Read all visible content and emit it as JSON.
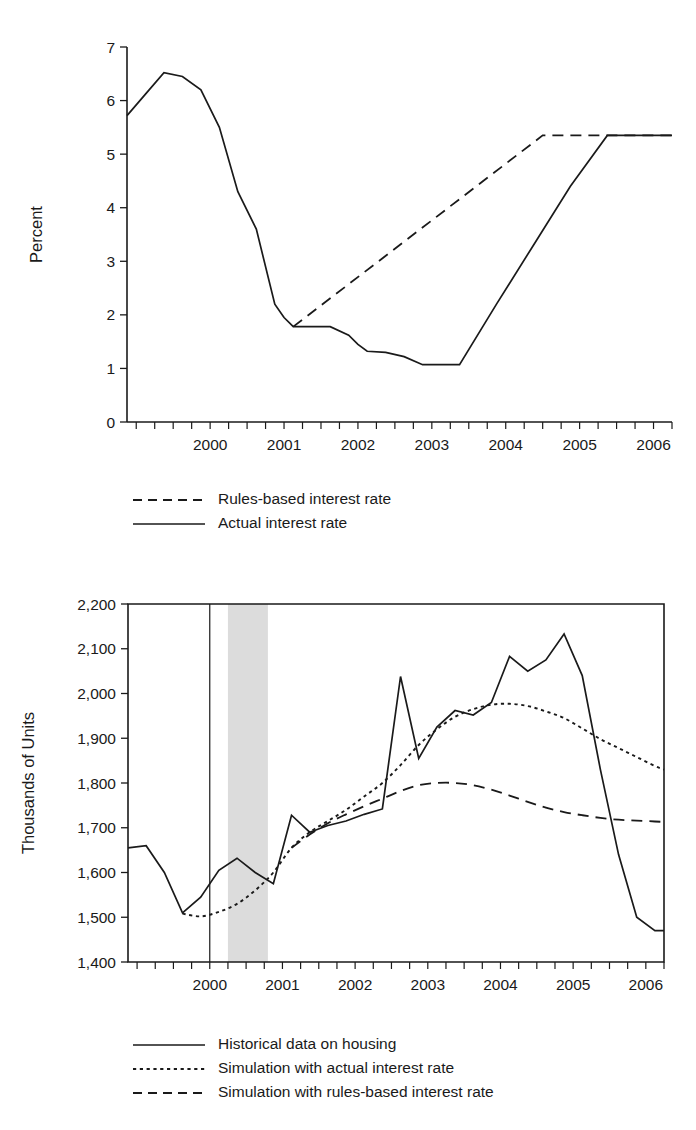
{
  "figure": {
    "background": "#ffffff",
    "ink_color": "#1a1a1a",
    "band_color": "#dcdcdc"
  },
  "chart_data": [
    {
      "id": "interest-rate-chart",
      "type": "line",
      "title": "",
      "xlabel": "",
      "ylabel": "Percent",
      "xlim": [
        1999.375,
        2006.75
      ],
      "ylim": [
        0,
        7
      ],
      "grid": false,
      "yticks": [
        0,
        1,
        2,
        3,
        4,
        5,
        6,
        7
      ],
      "ytick_labels": [
        "0",
        "1",
        "2",
        "3",
        "4",
        "5",
        "6",
        "7"
      ],
      "xtick_labels": [
        "2000",
        "2001",
        "2002",
        "2003",
        "2004",
        "2005",
        "2006"
      ],
      "xtick_label_positions": [
        2000.5,
        2001.5,
        2002.5,
        2003.5,
        2004.5,
        2005.5,
        2006.5
      ],
      "xtick_minor_step": 0.25,
      "legend_position": "below-left",
      "series": [
        {
          "name": "Rules-based interest rate",
          "style": "dashed",
          "x": [
            2001.625,
            2005.0,
            2006.75
          ],
          "values": [
            1.78,
            5.35,
            5.35
          ]
        },
        {
          "name": "Actual interest rate",
          "style": "solid",
          "x": [
            1999.375,
            1999.625,
            1999.875,
            2000.125,
            2000.375,
            2000.625,
            2000.875,
            2001.125,
            2001.375,
            2001.5,
            2001.625,
            2001.875,
            2002.125,
            2002.375,
            2002.5,
            2002.625,
            2002.875,
            2003.125,
            2003.375,
            2003.625,
            2003.875,
            2004.375,
            2004.875,
            2005.375,
            2005.875,
            2006.125,
            2006.375,
            2006.75
          ],
          "values": [
            5.72,
            6.12,
            6.52,
            6.45,
            6.2,
            5.5,
            4.3,
            3.6,
            2.2,
            1.95,
            1.78,
            1.78,
            1.78,
            1.62,
            1.45,
            1.32,
            1.3,
            1.22,
            1.07,
            1.07,
            1.07,
            2.2,
            3.3,
            4.4,
            5.35,
            5.35,
            5.35,
            5.35
          ]
        }
      ],
      "legend": [
        {
          "label": "Rules-based interest rate",
          "style": "dashed"
        },
        {
          "label": "Actual interest rate",
          "style": "solid"
        }
      ]
    },
    {
      "id": "housing-starts-chart",
      "type": "line",
      "title": "",
      "xlabel": "",
      "ylabel": "Thousands of Units",
      "xlim": [
        1999.375,
        2006.75
      ],
      "ylim": [
        1400,
        2200
      ],
      "grid": false,
      "yticks": [
        1400,
        1500,
        1600,
        1700,
        1800,
        1900,
        2000,
        2100,
        2200
      ],
      "ytick_labels": [
        "1,400",
        "1,500",
        "1,600",
        "1,700",
        "1,800",
        "1,900",
        "2,000",
        "2,100",
        "2,200"
      ],
      "xtick_labels": [
        "2000",
        "2001",
        "2002",
        "2003",
        "2004",
        "2005",
        "2006"
      ],
      "xtick_label_positions": [
        2000.5,
        2001.5,
        2002.5,
        2003.5,
        2004.5,
        2005.5,
        2006.5
      ],
      "xtick_minor_step": 0.25,
      "legend_position": "below-left",
      "recession_band": {
        "start": 2000.75,
        "end": 2001.3
      },
      "vertical_line": {
        "x": 2000.5
      },
      "series": [
        {
          "name": "Historical data on housing",
          "style": "solid",
          "x": [
            1999.375,
            1999.625,
            1999.875,
            2000.125,
            2000.375,
            2000.625,
            2000.875,
            2001.125,
            2001.375,
            2001.625,
            2001.875,
            2002.125,
            2002.375,
            2002.625,
            2002.875,
            2003.125,
            2003.375,
            2003.625,
            2003.875,
            2004.125,
            2004.375,
            2004.625,
            2004.875,
            2005.125,
            2005.375,
            2005.625,
            2005.875,
            2006.125,
            2006.375,
            2006.625,
            2006.75
          ],
          "values": [
            1655,
            1660,
            1600,
            1510,
            1545,
            1605,
            1632,
            1600,
            1575,
            1728,
            1690,
            1705,
            1715,
            1730,
            1742,
            2038,
            1855,
            1925,
            1962,
            1952,
            1980,
            2083,
            2050,
            2075,
            2133,
            2040,
            1830,
            1640,
            1500,
            1470,
            1470
          ]
        },
        {
          "name": "Simulation with actual interest rate",
          "style": "dotted",
          "x": [
            2000.125,
            2000.375,
            2000.625,
            2000.875,
            2001.125,
            2001.375,
            2001.625,
            2001.875,
            2002.125,
            2002.375,
            2002.625,
            2002.875,
            2003.125,
            2003.375,
            2003.625,
            2003.875,
            2004.125,
            2004.375,
            2004.625,
            2004.875,
            2005.125,
            2005.375,
            2005.625,
            2005.875,
            2006.125,
            2006.375,
            2006.625,
            2006.75
          ],
          "values": [
            1508,
            1502,
            1512,
            1530,
            1560,
            1600,
            1655,
            1690,
            1715,
            1740,
            1770,
            1800,
            1840,
            1885,
            1920,
            1948,
            1965,
            1975,
            1977,
            1972,
            1960,
            1945,
            1922,
            1898,
            1878,
            1858,
            1838,
            1830
          ]
        },
        {
          "name": "Simulation with rules-based interest rate",
          "style": "dashed",
          "x": [
            2001.625,
            2001.875,
            2002.125,
            2002.375,
            2002.625,
            2002.875,
            2003.125,
            2003.375,
            2003.625,
            2003.875,
            2004.125,
            2004.375,
            2004.625,
            2004.875,
            2005.125,
            2005.375,
            2005.625,
            2005.875,
            2006.125,
            2006.375,
            2006.625,
            2006.75
          ],
          "values": [
            1655,
            1685,
            1710,
            1730,
            1748,
            1765,
            1782,
            1795,
            1800,
            1800,
            1795,
            1785,
            1772,
            1758,
            1745,
            1735,
            1728,
            1722,
            1718,
            1716,
            1714,
            1713
          ]
        }
      ],
      "legend": [
        {
          "label": "Historical data on housing",
          "style": "solid"
        },
        {
          "label": "Simulation with actual interest rate",
          "style": "dotted"
        },
        {
          "label": "Simulation with rules-based interest rate",
          "style": "dashed"
        }
      ]
    }
  ]
}
